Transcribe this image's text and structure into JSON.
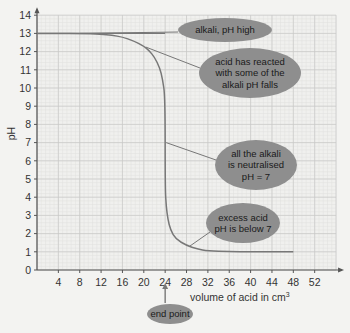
{
  "chart_data": {
    "type": "line",
    "title": "",
    "xlabel": "volume of acid in cm³",
    "xlabel_text": "volume of acid in cm",
    "xlabel_sup": "3",
    "ylabel": "pH",
    "xlim": [
      0,
      56
    ],
    "ylim": [
      0,
      14
    ],
    "x_ticks": [
      4,
      8,
      12,
      16,
      20,
      24,
      28,
      32,
      36,
      40,
      44,
      48,
      52
    ],
    "y_ticks": [
      0,
      1,
      2,
      3,
      4,
      5,
      6,
      7,
      8,
      9,
      10,
      11,
      12,
      13,
      14
    ],
    "grid": true,
    "legend": null,
    "series": [
      {
        "name": "pH curve",
        "x": [
          0,
          4,
          8,
          12,
          14,
          16,
          18,
          20,
          21,
          22,
          23,
          23.5,
          24,
          24,
          24.2,
          24.5,
          25,
          26,
          28,
          30,
          32,
          36,
          40,
          44,
          48
        ],
        "y": [
          13,
          13,
          13,
          12.95,
          12.9,
          12.8,
          12.6,
          12.3,
          12.05,
          11.7,
          11.1,
          10.5,
          9.5,
          4.5,
          3.5,
          2.8,
          2.2,
          1.7,
          1.35,
          1.15,
          1.05,
          1.0,
          1.0,
          1.0,
          1.0
        ]
      },
      {
        "name": "initial level",
        "x": [
          0,
          24
        ],
        "y": [
          13,
          13
        ]
      }
    ],
    "annotations": [
      {
        "text": [
          "alkali, pH high"
        ],
        "points_to": [
          8,
          13
        ]
      },
      {
        "text": [
          "acid has reacted",
          "with some of the",
          "alkali pH falls"
        ],
        "points_to": [
          20,
          12.3
        ]
      },
      {
        "text": [
          "all the alkali",
          "is neutralised",
          "pH = 7"
        ],
        "points_to": [
          24,
          7
        ]
      },
      {
        "text": [
          "excess acid",
          "pH is below 7"
        ],
        "points_to": [
          28,
          1.35
        ]
      },
      {
        "text": [
          "end point"
        ],
        "points_to": [
          24,
          0
        ]
      }
    ]
  },
  "colors": {
    "background": "#f3f3f1",
    "grid_minor": "#e0e0de",
    "grid_major": "#c9c9c7",
    "axis": "#555555",
    "curve": "#777777",
    "bubble": "#8e8e8e",
    "bubble_text": "#1a1a1a"
  }
}
